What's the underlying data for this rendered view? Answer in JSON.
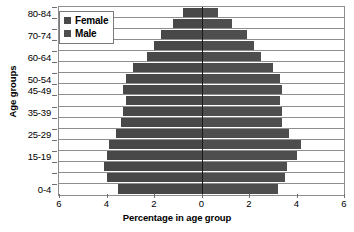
{
  "chart_data": {
    "type": "bar",
    "subtype": "population-pyramid",
    "title": "",
    "xlabel": "Percentage in age group",
    "ylabel": "Age groups",
    "orientation": "horizontal-diverging",
    "grid": false,
    "legend_position": "top-left",
    "xlim": [
      -6,
      6
    ],
    "xticks": [
      6,
      4,
      2,
      0,
      2,
      4,
      6
    ],
    "xtick_positions": [
      -6,
      -4,
      -2,
      0,
      2,
      4,
      6
    ],
    "axis_note": "Left side values increase leftward from 0 to 6",
    "categories": [
      "0-4",
      "5-9",
      "10-14",
      "15-19",
      "20-24",
      "25-29",
      "30-34",
      "35-39",
      "40-44",
      "45-49",
      "50-54",
      "55-59",
      "60-64",
      "65-69",
      "70-74",
      "75-79",
      "80-84"
    ],
    "ytick_labels_shown": [
      "0-4",
      "15-19",
      "25-29",
      "35-39",
      "45-49",
      "50-54",
      "60-64",
      "70-74",
      "80-84"
    ],
    "series": [
      {
        "name": "Female",
        "color": "#484848",
        "side": "left",
        "values": [
          3.5,
          4.0,
          4.1,
          4.0,
          3.9,
          3.6,
          3.4,
          3.3,
          3.2,
          3.3,
          3.2,
          2.9,
          2.3,
          2.0,
          1.7,
          1.2,
          0.8
        ]
      },
      {
        "name": "Male",
        "color": "#4e4e4e",
        "side": "right",
        "values": [
          3.2,
          3.5,
          3.6,
          4.0,
          4.2,
          3.7,
          3.4,
          3.4,
          3.3,
          3.4,
          3.3,
          3.0,
          2.5,
          2.2,
          1.9,
          1.3,
          0.7
        ]
      }
    ]
  },
  "legend": {
    "items": [
      {
        "label": "Female",
        "color": "#484848"
      },
      {
        "label": "Male",
        "color": "#4e4e4e"
      }
    ]
  },
  "axes": {
    "x_title": "Percentage in age group",
    "y_title": "Age groups"
  }
}
